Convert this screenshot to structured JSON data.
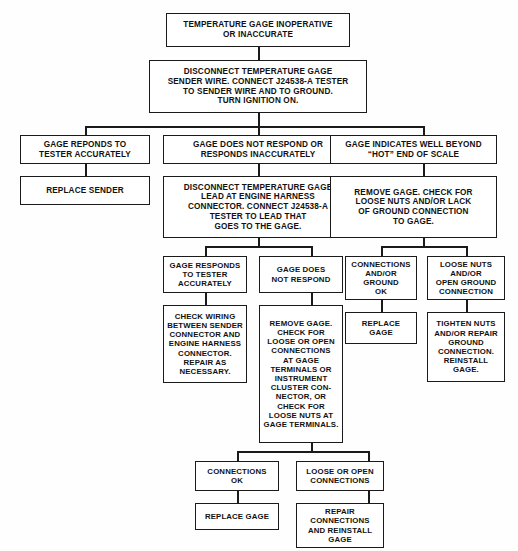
{
  "diagram": {
    "type": "flowchart",
    "background_color": "#fefefe",
    "line_color": "#1a1a1a",
    "box_fill": "#ffffff",
    "nodes": {
      "start": "TEMPERATURE GAGE INOPERATIVE\nOR INACCURATE",
      "step1": "DISCONNECT TEMPERATURE GAGE\nSENDER WIRE. CONNECT J24538-A TESTER\nTO SENDER WIRE AND TO GROUND.\nTURN IGNITION ON.",
      "b1_cond": "GAGE REPONDS TO\nTESTER ACCURATELY",
      "b1_act": "REPLACE SENDER",
      "b2_cond": "GAGE DOES NOT RESPOND OR\nRESPONDS INACCURATELY",
      "b2_step": "DISCONNECT TEMPERATURE GAGE\nLEAD AT ENGINE HARNESS\nCONNECTOR. CONNECT J24538-A\nTESTER TO LEAD THAT\nGOES TO THE GAGE.",
      "b3_cond": "GAGE INDICATES WELL BEYOND\n“HOT” END OF SCALE",
      "b3_step": "REMOVE GAGE. CHECK FOR\nLOOSE NUTS AND/OR LACK\nOF GROUND CONNECTION\nTO GAGE.",
      "b2a_cond": "GAGE RESPONDS\nTO TESTER\nACCURATELY",
      "b2a_act": "CHECK WIRING\nBETWEEN SENDER\nCONNECTOR AND\nENGINE HARNESS\nCONNECTOR.\nREPAIR AS\nNECESSARY.",
      "b2b_cond": "GAGE DOES\nNOT RESPOND",
      "b2b_act": "REMOVE GAGE.\nCHECK FOR\nLOOSE OR OPEN\nCONNECTIONS\nAT GAGE\nTERMINALS OR\nINSTRUMENT\nCLUSTER CON-\nNECTOR, OR\nCHECK FOR\nLOOSE NUTS AT\nGAGE TERMINALS.",
      "b3a_cond": "CONNECTIONS\nAND/OR\nGROUND\nOK",
      "b3a_act": "REPLACE\nGAGE",
      "b3b_cond": "LOOSE NUTS\nAND/OR\nOPEN GROUND\nCONNECTION",
      "b3b_act": "TIGHTEN NUTS\nAND/OR REPAIR\nGROUND\nCONNECTION.\nREINSTALL\nGAGE.",
      "b4a_cond": "CONNECTIONS\nOK",
      "b4a_act": "REPLACE GAGE",
      "b4b_cond": "LOOSE OR OPEN\nCONNECTIONS",
      "b4b_act": "REPAIR\nCONNECTIONS\nAND REINSTALL\nGAGE"
    }
  }
}
